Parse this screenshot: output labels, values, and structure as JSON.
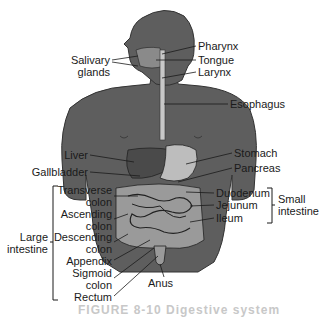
{
  "figure": {
    "caption": "FIGURE 8-10 Digestive system"
  },
  "labels": {
    "salivary_glands": "Salivary\nglands",
    "salivary_glands_line1": "Salivary",
    "salivary_glands_line2": "glands",
    "pharynx": "Pharynx",
    "tongue": "Tongue",
    "larynx": "Larynx",
    "esophagus": "Esophagus",
    "liver": "Liver",
    "gallbladder": "Gallbladder",
    "stomach": "Stomach",
    "pancreas": "Pancreas",
    "transverse_colon_1": "Transverse",
    "transverse_colon_2": "colon",
    "ascending_colon_1": "Ascending",
    "ascending_colon_2": "colon",
    "descending_colon_1": "Descending",
    "descending_colon_2": "colon",
    "appendix": "Appendix",
    "sigmoid_colon_1": "Sigmoid",
    "sigmoid_colon_2": "colon",
    "rectum": "Rectum",
    "anus": "Anus",
    "duodenum": "Duodenum",
    "jejunum": "Jejunum",
    "ileum": "Ileum"
  },
  "groups": {
    "large_intestine_1": "Large",
    "large_intestine_2": "intestine",
    "small_intestine_1": "Small",
    "small_intestine_2": "intestine"
  },
  "colors": {
    "body": "#5e5e5e",
    "organ_dark": "#4a4a4a",
    "organ_light": "#bdbdbd",
    "intestine": "#9a9a9a",
    "line": "#1a1a1a",
    "background": "#ffffff"
  }
}
